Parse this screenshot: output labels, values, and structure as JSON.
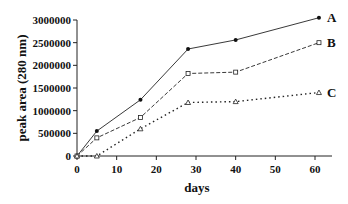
{
  "chart_data": {
    "type": "line",
    "title": "",
    "xlabel": "days",
    "ylabel": "peak area (280 nm)",
    "xlim": [
      0,
      65
    ],
    "ylim": [
      0,
      3000000
    ],
    "x_ticks": [
      "0",
      "10",
      "20",
      "30",
      "40",
      "50",
      "60"
    ],
    "y_ticks": [
      "0",
      "500000",
      "1000000",
      "1500000",
      "2000000",
      "2500000",
      "3000000"
    ],
    "grid": false,
    "legend_position": "inline-right",
    "x": [
      0,
      5,
      16,
      28,
      40,
      61
    ],
    "series": [
      {
        "name": "A",
        "style": "solid",
        "marker": "filled-circle",
        "values": [
          0,
          550000,
          1240000,
          2360000,
          2560000,
          3050000
        ]
      },
      {
        "name": "B",
        "style": "dashed",
        "marker": "open-square",
        "values": [
          0,
          400000,
          850000,
          1820000,
          1850000,
          2500000
        ]
      },
      {
        "name": "C",
        "style": "dotted",
        "marker": "open-triangle",
        "values": [
          0,
          0,
          600000,
          1180000,
          1200000,
          1400000
        ]
      }
    ]
  }
}
